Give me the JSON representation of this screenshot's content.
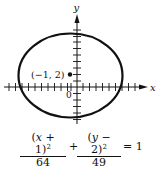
{
  "diagram": {
    "type": "ellipse-graph",
    "axes": {
      "x_label": "x",
      "y_label": "y",
      "origin_label": "0"
    },
    "center": {
      "label": "(−1, 2)",
      "x": -1,
      "y": 2
    },
    "ellipse": {
      "h": -1,
      "k": 2,
      "a_squared": 64,
      "b_squared": 49,
      "a": 8,
      "b": 7
    },
    "colors": {
      "stroke": "#111111",
      "background": "#ffffff"
    }
  },
  "equation": {
    "num1_pre": "(",
    "num1_var": "x",
    "num1_post": " + 1)",
    "num1_exp": "2",
    "den1": "64",
    "plus": "+",
    "num2_pre": "(",
    "num2_var": "y",
    "num2_post": " − 2)",
    "num2_exp": "2",
    "den2": "49",
    "equals": "= 1"
  }
}
